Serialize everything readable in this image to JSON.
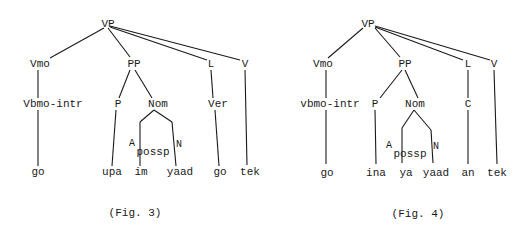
{
  "figures": [
    {
      "caption": "(Fig. 3)",
      "nodes": {
        "root": "VP",
        "vmo": "Vmo",
        "pp": "PP",
        "l": "L",
        "v": "V",
        "vbmo": "Vbmo-intr",
        "p": "P",
        "nom": "Nom",
        "ver": "Ver",
        "a": "A",
        "possp": "possp",
        "n": "N"
      },
      "leaves": [
        "go",
        "upa",
        "im",
        "yaad",
        "go",
        "tek"
      ]
    },
    {
      "caption": "(Fig. 4)",
      "nodes": {
        "root": "VP",
        "vmo": "Vmo",
        "pp": "PP",
        "l": "L",
        "v": "V",
        "vbmo": "vbmo-intr",
        "p": "P",
        "nom": "Nom",
        "c": "C",
        "a": "A",
        "possp": "possp",
        "n": "N"
      },
      "leaves": [
        "go",
        "ina",
        "ya",
        "yaad",
        "an",
        "tek"
      ]
    }
  ]
}
